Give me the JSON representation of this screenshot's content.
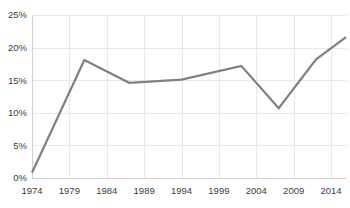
{
  "chart_data": {
    "type": "line",
    "title": "",
    "subtitle": "",
    "xlabel": "",
    "ylabel": "",
    "xlim": [
      1974,
      2016
    ],
    "ylim": [
      0,
      25
    ],
    "grid": true,
    "legend": false,
    "legend_position": "none",
    "x_tick_labels": [
      "1974",
      "1979",
      "1984",
      "1989",
      "1994",
      "1999",
      "2004",
      "2009",
      "2014"
    ],
    "x_tick_values": [
      1974,
      1979,
      1984,
      1989,
      1994,
      1999,
      2004,
      2009,
      2014
    ],
    "y_tick_labels": [
      "0%",
      "5%",
      "10%",
      "15%",
      "20%",
      "25%"
    ],
    "y_tick_values": [
      0,
      5,
      10,
      15,
      20,
      25
    ],
    "x": [
      1974,
      1981,
      1987,
      1994,
      2002,
      2007,
      2012,
      2016
    ],
    "series": [
      {
        "name": "series-1",
        "color": "#808080",
        "values": [
          0.8,
          18.1,
          14.6,
          15.1,
          17.2,
          10.7,
          18.2,
          21.6
        ]
      }
    ],
    "annotations": []
  },
  "style": {
    "line_color": "#808080",
    "grid_color": "#e8e8e8",
    "axis_color": "#d0d0d0",
    "tick_text_color": "#3c3c3c",
    "background_color": "#ffffff",
    "line_width": 2.2
  }
}
